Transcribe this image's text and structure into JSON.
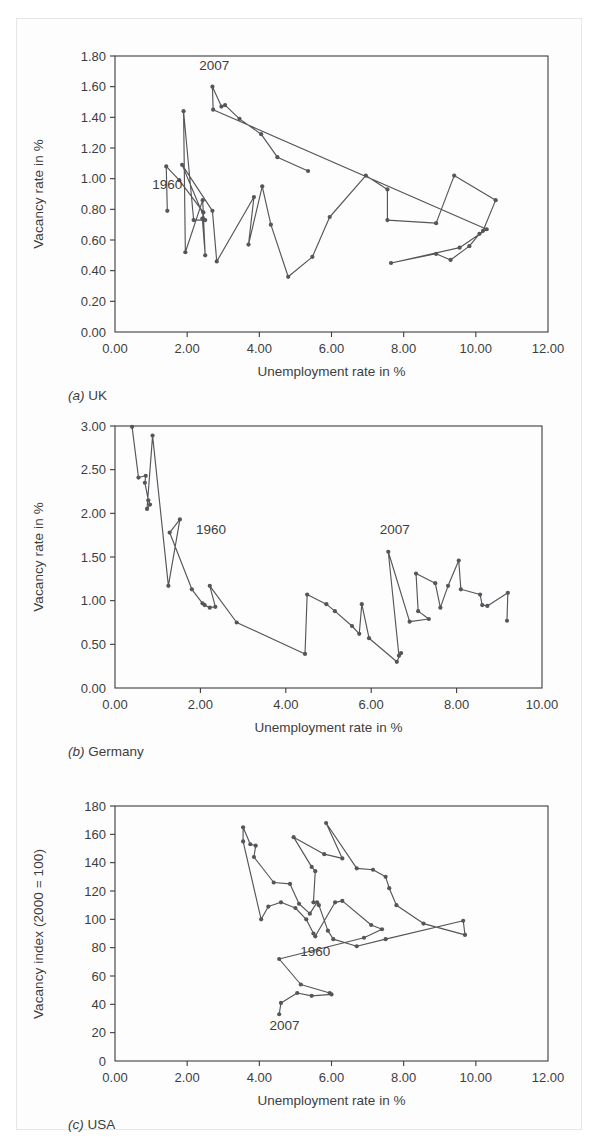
{
  "figure": {
    "background": "#ffffff",
    "series_color": "#55555a",
    "axis_color": "#3d3d3d"
  },
  "panels": [
    {
      "key": "uk",
      "caption_prefix": "(a)",
      "caption_label": "UK",
      "xlabel": "Unemployment rate in %",
      "ylabel": "Vacancy rate in %"
    },
    {
      "key": "germany",
      "caption_prefix": "(b)",
      "caption_label": "Germany",
      "xlabel": "Unemployment rate in %",
      "ylabel": "Vacancy rate in %"
    },
    {
      "key": "usa",
      "caption_prefix": "(c)",
      "caption_label": "USA",
      "xlabel": "Unemployment rate in %",
      "ylabel": "Vacancy index (2000 = 100)"
    }
  ],
  "chart_data": [
    {
      "type": "line",
      "key": "uk",
      "title": "(a) UK",
      "xlabel": "Unemployment rate in %",
      "ylabel": "Vacancy rate in %",
      "xlim": [
        0.0,
        12.0
      ],
      "ylim": [
        0.0,
        1.8
      ],
      "xticks": [
        0.0,
        2.0,
        4.0,
        6.0,
        8.0,
        10.0,
        12.0
      ],
      "xticklabels": [
        "0.00",
        "2.00",
        "4.00",
        "6.00",
        "8.00",
        "10.00",
        "12.00"
      ],
      "yticks": [
        0.0,
        0.2,
        0.4,
        0.6,
        0.8,
        1.0,
        1.2,
        1.4,
        1.6,
        1.8
      ],
      "yticklabels": [
        "0.00",
        "0.20",
        "0.40",
        "0.60",
        "0.80",
        "1.00",
        "1.20",
        "1.40",
        "1.60",
        "1.80"
      ],
      "grid": false,
      "legend": "none",
      "annotations": [
        {
          "text": "1960",
          "x": 1.45,
          "y": 0.93
        },
        {
          "text": "2007",
          "x": 2.75,
          "y": 1.71
        }
      ],
      "series": [
        {
          "name": "UK Beveridge curve 1960-2007",
          "points": [
            [
              1.45,
              0.79
            ],
            [
              1.42,
              1.08
            ],
            [
              1.78,
              0.99
            ],
            [
              2.45,
              0.78
            ],
            [
              2.42,
              0.74
            ],
            [
              2.5,
              0.5
            ],
            [
              2.43,
              0.86
            ],
            [
              1.95,
              0.52
            ],
            [
              1.9,
              1.44
            ],
            [
              2.18,
              0.73
            ],
            [
              2.5,
              0.73
            ],
            [
              1.86,
              1.09
            ],
            [
              2.7,
              0.79
            ],
            [
              2.82,
              0.46
            ],
            [
              3.85,
              0.88
            ],
            [
              3.7,
              0.57
            ],
            [
              4.08,
              0.95
            ],
            [
              4.32,
              0.7
            ],
            [
              4.8,
              0.36
            ],
            [
              5.47,
              0.49
            ],
            [
              5.95,
              0.75
            ],
            [
              6.95,
              1.02
            ],
            [
              7.55,
              0.93
            ],
            [
              7.55,
              0.73
            ],
            [
              8.9,
              0.71
            ],
            [
              9.4,
              1.02
            ],
            [
              10.55,
              0.86
            ],
            [
              10.2,
              0.66
            ],
            [
              10.1,
              0.64
            ],
            [
              9.82,
              0.56
            ],
            [
              9.3,
              0.47
            ],
            [
              8.9,
              0.51
            ],
            [
              7.65,
              0.45
            ],
            [
              9.55,
              0.55
            ],
            [
              10.3,
              0.67
            ],
            [
              2.72,
              1.45
            ],
            [
              2.7,
              1.6
            ],
            [
              2.95,
              1.47
            ],
            [
              3.05,
              1.48
            ],
            [
              3.45,
              1.39
            ],
            [
              4.05,
              1.29
            ],
            [
              4.5,
              1.14
            ],
            [
              5.35,
              1.05
            ]
          ]
        }
      ]
    },
    {
      "type": "line",
      "key": "germany",
      "title": "(b) Germany",
      "xlabel": "Unemployment rate in %",
      "ylabel": "Vacancy rate in %",
      "xlim": [
        0.0,
        10.0
      ],
      "ylim": [
        0.0,
        3.0
      ],
      "xticks": [
        0.0,
        2.0,
        4.0,
        6.0,
        8.0,
        10.0
      ],
      "xticklabels": [
        "0.00",
        "2.00",
        "4.00",
        "6.00",
        "8.00",
        "10.00"
      ],
      "yticks": [
        0.0,
        0.5,
        1.0,
        1.5,
        2.0,
        2.5,
        3.0
      ],
      "yticklabels": [
        "0.00",
        "0.50",
        "1.00",
        "1.50",
        "2.00",
        "2.50",
        "3.00"
      ],
      "grid": false,
      "legend": "none",
      "annotations": [
        {
          "text": "1960",
          "x": 2.25,
          "y": 1.76
        },
        {
          "text": "2007",
          "x": 6.55,
          "y": 1.76
        }
      ],
      "series": [
        {
          "name": "Germany Beveridge curve 1960-2007",
          "points": [
            [
              0.4,
              2.99
            ],
            [
              0.55,
              2.41
            ],
            [
              0.72,
              2.43
            ],
            [
              0.7,
              2.35
            ],
            [
              0.78,
              2.15
            ],
            [
              0.82,
              2.1
            ],
            [
              0.75,
              2.05
            ],
            [
              0.88,
              2.89
            ],
            [
              1.25,
              1.17
            ],
            [
              1.52,
              1.93
            ],
            [
              1.28,
              1.78
            ],
            [
              1.8,
              1.13
            ],
            [
              2.05,
              0.97
            ],
            [
              2.1,
              0.95
            ],
            [
              2.22,
              0.92
            ],
            [
              2.35,
              0.93
            ],
            [
              2.22,
              1.17
            ],
            [
              2.85,
              0.75
            ],
            [
              4.45,
              0.39
            ],
            [
              4.5,
              1.07
            ],
            [
              4.95,
              0.96
            ],
            [
              5.15,
              0.88
            ],
            [
              5.55,
              0.71
            ],
            [
              5.72,
              0.62
            ],
            [
              5.78,
              0.96
            ],
            [
              5.95,
              0.57
            ],
            [
              6.6,
              0.3
            ],
            [
              6.7,
              0.4
            ],
            [
              6.65,
              0.37
            ],
            [
              6.4,
              1.56
            ],
            [
              6.9,
              0.76
            ],
            [
              7.35,
              0.79
            ],
            [
              7.1,
              0.88
            ],
            [
              7.05,
              1.31
            ],
            [
              7.5,
              1.2
            ],
            [
              7.62,
              0.92
            ],
            [
              7.8,
              1.17
            ],
            [
              8.05,
              1.46
            ],
            [
              8.1,
              1.13
            ],
            [
              8.55,
              1.07
            ],
            [
              8.6,
              0.95
            ],
            [
              8.72,
              0.94
            ],
            [
              9.2,
              1.09
            ],
            [
              9.18,
              0.77
            ]
          ]
        }
      ]
    },
    {
      "type": "line",
      "key": "usa",
      "title": "(c) USA",
      "xlabel": "Unemployment rate in %",
      "ylabel": "Vacancy index (2000 = 100)",
      "xlim": [
        0.0,
        12.0
      ],
      "ylim": [
        0,
        180
      ],
      "xticks": [
        0.0,
        2.0,
        4.0,
        6.0,
        8.0,
        10.0,
        12.0
      ],
      "xticklabels": [
        "0.00",
        "2.00",
        "4.00",
        "6.00",
        "8.00",
        "10.00",
        "12.00"
      ],
      "yticks": [
        0,
        20,
        40,
        60,
        80,
        100,
        120,
        140,
        160,
        180
      ],
      "yticklabels": [
        "0",
        "20",
        "40",
        "60",
        "80",
        "100",
        "120",
        "140",
        "160",
        "180"
      ],
      "grid": false,
      "legend": "none",
      "annotations": [
        {
          "text": "1960",
          "x": 5.55,
          "y": 74
        },
        {
          "text": "2007",
          "x": 4.7,
          "y": 22
        }
      ],
      "series": [
        {
          "name": "USA Beveridge curve 1960-2007",
          "points": [
            [
              5.5,
              112
            ],
            [
              5.55,
              134
            ],
            [
              5.45,
              137
            ],
            [
              4.95,
              158
            ],
            [
              5.8,
              146
            ],
            [
              6.3,
              143
            ],
            [
              5.85,
              168
            ],
            [
              6.7,
              136
            ],
            [
              7.15,
              135
            ],
            [
              7.5,
              130
            ],
            [
              7.6,
              122
            ],
            [
              7.8,
              110
            ],
            [
              8.55,
              97
            ],
            [
              9.7,
              89
            ],
            [
              9.65,
              99
            ],
            [
              7.5,
              86
            ],
            [
              6.7,
              81
            ],
            [
              6.05,
              86
            ],
            [
              5.9,
              92
            ],
            [
              5.65,
              110
            ],
            [
              5.6,
              112
            ],
            [
              5.4,
              104
            ],
            [
              5.1,
              111
            ],
            [
              4.85,
              125
            ],
            [
              4.4,
              126
            ],
            [
              3.85,
              144
            ],
            [
              3.9,
              152
            ],
            [
              3.75,
              153
            ],
            [
              3.55,
              165
            ],
            [
              3.55,
              155
            ],
            [
              4.05,
              100
            ],
            [
              4.25,
              109
            ],
            [
              4.6,
              112
            ],
            [
              5.0,
              108
            ],
            [
              5.3,
              100
            ],
            [
              5.5,
              90
            ],
            [
              5.55,
              88
            ],
            [
              6.1,
              112
            ],
            [
              6.3,
              113
            ],
            [
              7.1,
              96
            ],
            [
              7.4,
              93
            ],
            [
              6.9,
              87
            ],
            [
              4.55,
              72
            ],
            [
              5.15,
              54
            ],
            [
              5.95,
              48
            ],
            [
              6.0,
              47
            ],
            [
              5.45,
              46
            ],
            [
              5.05,
              48
            ],
            [
              4.6,
              41
            ],
            [
              4.55,
              33
            ]
          ]
        }
      ]
    }
  ]
}
